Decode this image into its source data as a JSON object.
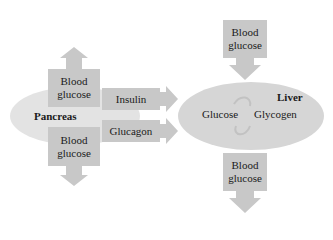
{
  "diagram": {
    "colors": {
      "background": "#ffffff",
      "box_fill": "#c8c8c8",
      "pancreas_fill": "#e3e3e3",
      "liver_fill": "#d6d6d6",
      "arrow_fill": "#c8c8c8",
      "cycle_arrow": "#c2c2c2",
      "text": "#1a1a1a"
    },
    "pancreas": {
      "label": "Pancreas",
      "blood_glucose_top": {
        "line1": "Blood",
        "line2": "glucose",
        "arrow_direction": "up"
      },
      "blood_glucose_bottom": {
        "line1": "Blood",
        "line2": "glucose",
        "arrow_direction": "down"
      }
    },
    "hormones": [
      {
        "label": "Insulin",
        "arrow_direction": "right"
      },
      {
        "label": "Glucagon",
        "arrow_direction": "right"
      }
    ],
    "liver": {
      "label": "Liver",
      "left_term": "Glucose",
      "right_term": "Glycogen",
      "blood_glucose_in": {
        "line1": "Blood",
        "line2": "glucose",
        "arrow_direction": "down"
      },
      "blood_glucose_out": {
        "line1": "Blood",
        "line2": "glucose",
        "arrow_direction": "down"
      }
    }
  }
}
